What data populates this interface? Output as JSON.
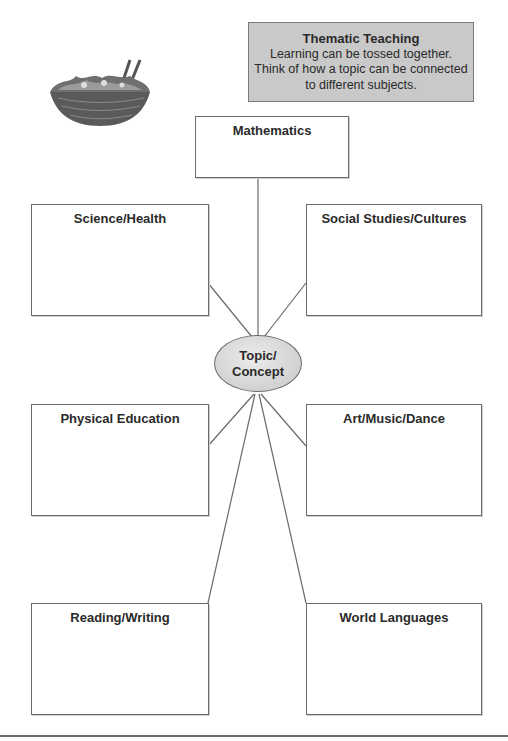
{
  "info_box": {
    "title": "Thematic Teaching",
    "line1": "Learning can be tossed together.",
    "line2": "Think of how a topic can be connected",
    "line3": "to different subjects."
  },
  "center": {
    "line1": "Topic/",
    "line2": "Concept"
  },
  "subjects": {
    "mathematics": "Mathematics",
    "science": "Science/Health",
    "social": "Social Studies/Cultures",
    "pe": "Physical Education",
    "art": "Art/Music/Dance",
    "reading": "Reading/Writing",
    "languages": "World Languages"
  },
  "illustration": "salad-bowl-icon",
  "colors": {
    "info_bg": "#c9c9c9",
    "ellipse_fill": "#d6d6d6",
    "stroke": "#6a6a6a"
  }
}
